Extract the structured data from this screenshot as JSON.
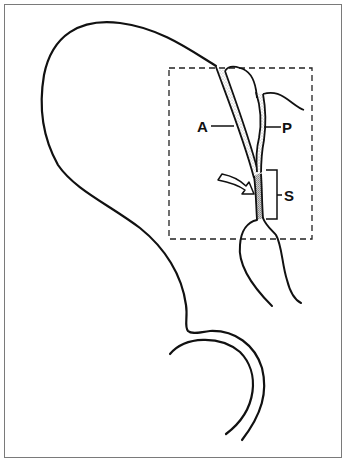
{
  "figure": {
    "type": "anatomical-line-drawing",
    "colors": {
      "stroke": "#111111",
      "frame": "#7a7a7a",
      "stipple": "#b8b8b8",
      "stipple_dense": "#8a8a8a",
      "background": "#ffffff"
    },
    "labels": {
      "a": "A",
      "p": "P",
      "s": "S"
    },
    "annotations": {
      "inset_box": "dashed-rectangle",
      "arrow": "curved-pointer-arrow",
      "bracket": "bracket-S"
    }
  }
}
